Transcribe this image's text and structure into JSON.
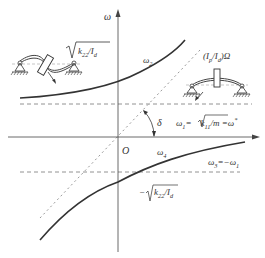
{
  "diagram": {
    "type": "campbell-diagram",
    "colors": {
      "axis": "#444444",
      "curve": "#333333",
      "dashed": "#777777",
      "dotted": "#999999",
      "text": "#333333"
    },
    "axes": {
      "y_label": "ω",
      "origin_label": "O"
    },
    "labels": {
      "top_sqrt": "k22/Id",
      "omega2": "ω2",
      "asymptote": "(Ip/Id)Ω",
      "delta": "δ",
      "omega1_eq": "ω1=√(k11/m) =ω*",
      "omega4": "ω4",
      "omega3_eq": "ω3=−ω1",
      "bottom_sqrt": "−√(k22/Id)"
    },
    "figures": {
      "left_rotor": "tilting-disk rotor on simple supports",
      "right_rotor": "translating-disk rotor on simple supports"
    }
  }
}
